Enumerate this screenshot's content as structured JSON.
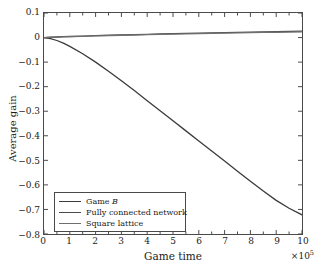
{
  "chart_data": {
    "type": "line",
    "title": "",
    "xlabel": "Game time",
    "ylabel": "Average gain",
    "x_offset_text": "×10",
    "x_offset_exponent": "5",
    "xlim": [
      0,
      10
    ],
    "ylim": [
      -0.8,
      0.1
    ],
    "grid": false,
    "legend_position": "lower-left",
    "xticks": [
      "0",
      "1",
      "2",
      "3",
      "4",
      "5",
      "6",
      "7",
      "8",
      "9",
      "10"
    ],
    "xtick_values": [
      0,
      1,
      2,
      3,
      4,
      5,
      6,
      7,
      8,
      9,
      10
    ],
    "yticks": [
      "0.1",
      "0",
      "−0.1",
      "−0.2",
      "−0.3",
      "−0.4",
      "−0.5",
      "−0.6",
      "−0.7",
      "−0.8"
    ],
    "ytick_values": [
      0.1,
      0,
      -0.1,
      -0.2,
      -0.3,
      -0.4,
      -0.5,
      -0.6,
      -0.7,
      -0.8
    ],
    "x": [
      0,
      0.25,
      0.5,
      0.75,
      1,
      1.5,
      2,
      2.5,
      3,
      3.5,
      4,
      4.5,
      5,
      5.5,
      6,
      6.5,
      7,
      7.5,
      8,
      8.5,
      9,
      9.5,
      10
    ],
    "series": [
      {
        "name": "Game B",
        "color": "#3b3b3b",
        "values": [
          0,
          -0.004,
          -0.012,
          -0.023,
          -0.036,
          -0.066,
          -0.1,
          -0.137,
          -0.176,
          -0.216,
          -0.257,
          -0.298,
          -0.339,
          -0.38,
          -0.421,
          -0.462,
          -0.503,
          -0.544,
          -0.585,
          -0.625,
          -0.663,
          -0.695,
          -0.722
        ]
      },
      {
        "name": "Fully connected network",
        "color": "#4a4a4a",
        "values": [
          0,
          0.0012,
          0.0023,
          0.0034,
          0.0044,
          0.0062,
          0.0078,
          0.0093,
          0.0107,
          0.012,
          0.0133,
          0.0145,
          0.0157,
          0.0168,
          0.0179,
          0.019,
          0.0201,
          0.0211,
          0.0221,
          0.0231,
          0.0241,
          0.0251,
          0.026
        ]
      },
      {
        "name": "Square lattice",
        "color": "#6f6f6f",
        "values": [
          0,
          0.0009,
          0.0018,
          0.0027,
          0.0036,
          0.0052,
          0.0066,
          0.008,
          0.0093,
          0.0105,
          0.0117,
          0.0128,
          0.0139,
          0.015,
          0.016,
          0.017,
          0.018,
          0.0189,
          0.0198,
          0.0207,
          0.0216,
          0.0225,
          0.0233
        ]
      }
    ],
    "legend_entries": [
      {
        "label": "Game ",
        "label_italic": "B",
        "color": "#3b3b3b"
      },
      {
        "label": "Fully connected network",
        "label_italic": "",
        "color": "#4a4a4a"
      },
      {
        "label": "Square lattice",
        "label_italic": "",
        "color": "#6f6f6f"
      }
    ]
  }
}
